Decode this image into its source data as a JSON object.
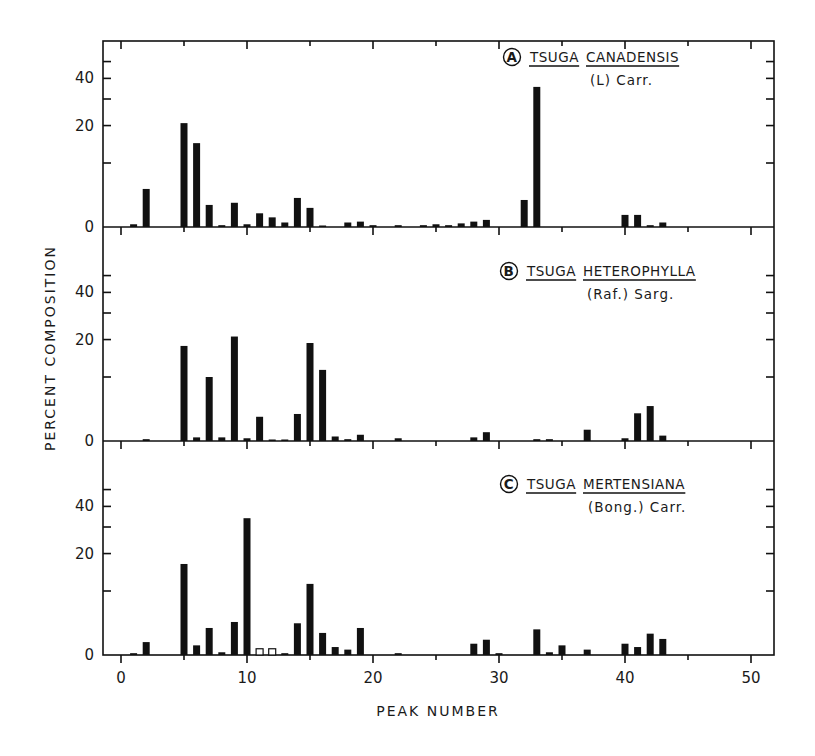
{
  "chart_data": {
    "type": "bar",
    "layout": "three vertically stacked panels sharing x-axis",
    "xlabel": "PEAK NUMBER",
    "ylabel": "PERCENT COMPOSITION",
    "x_ticks": [
      0,
      10,
      20,
      30,
      40,
      50
    ],
    "x_minor_ticks": [
      5,
      15,
      25,
      35,
      45
    ],
    "xlim": [
      -1.4,
      51.8
    ],
    "y_ticks": [
      0,
      20,
      40
    ],
    "y_minor_ticks": [
      10,
      30,
      50
    ],
    "y_scale": "nonlinear (approx. log10(1 + y/10))",
    "grid": false,
    "panels": [
      {
        "id": "A",
        "label": "A",
        "species": [
          "TSUGA",
          "CANADENSIS"
        ],
        "authority": "(L) Carr.",
        "bars": [
          {
            "peak": 1,
            "value": 0.3
          },
          {
            "peak": 2,
            "value": 5.1
          },
          {
            "peak": 5,
            "value": 20.8
          },
          {
            "peak": 6,
            "value": 14.8
          },
          {
            "peak": 7,
            "value": 2.7
          },
          {
            "peak": 8,
            "value": 0.2
          },
          {
            "peak": 9,
            "value": 3.0
          },
          {
            "peak": 10,
            "value": 0.3
          },
          {
            "peak": 11,
            "value": 1.6
          },
          {
            "peak": 12,
            "value": 1.1
          },
          {
            "peak": 13,
            "value": 0.5
          },
          {
            "peak": 14,
            "value": 3.7
          },
          {
            "peak": 15,
            "value": 2.3
          },
          {
            "peak": 16,
            "value": 0.1
          },
          {
            "peak": 18,
            "value": 0.5
          },
          {
            "peak": 19,
            "value": 0.6
          },
          {
            "peak": 20,
            "value": 0.2
          },
          {
            "peak": 22,
            "value": 0.2
          },
          {
            "peak": 24,
            "value": 0.2
          },
          {
            "peak": 25,
            "value": 0.3
          },
          {
            "peak": 26,
            "value": 0.2
          },
          {
            "peak": 27,
            "value": 0.4
          },
          {
            "peak": 28,
            "value": 0.6
          },
          {
            "peak": 29,
            "value": 0.8
          },
          {
            "peak": 32,
            "value": 3.4
          },
          {
            "peak": 33,
            "value": 35.6
          },
          {
            "peak": 40,
            "value": 1.4
          },
          {
            "peak": 41,
            "value": 1.4
          },
          {
            "peak": 42,
            "value": 0.2
          },
          {
            "peak": 43,
            "value": 0.5
          }
        ]
      },
      {
        "id": "B",
        "label": "B",
        "species": [
          "TSUGA",
          "HETEROPHYLLA"
        ],
        "authority": "(Raf.) Sarg.",
        "bars": [
          {
            "peak": 2,
            "value": 0.2
          },
          {
            "peak": 5,
            "value": 18.0
          },
          {
            "peak": 6,
            "value": 0.4
          },
          {
            "peak": 7,
            "value": 10.0
          },
          {
            "peak": 8,
            "value": 0.4
          },
          {
            "peak": 9,
            "value": 21.0
          },
          {
            "peak": 10,
            "value": 0.3
          },
          {
            "peak": 11,
            "value": 3.0
          },
          {
            "peak": 12,
            "value": 0.1
          },
          {
            "peak": 13,
            "value": 0.1
          },
          {
            "peak": 14,
            "value": 3.4
          },
          {
            "peak": 15,
            "value": 18.9
          },
          {
            "peak": 16,
            "value": 11.6
          },
          {
            "peak": 17,
            "value": 0.5
          },
          {
            "peak": 18,
            "value": 0.2
          },
          {
            "peak": 19,
            "value": 0.7
          },
          {
            "peak": 22,
            "value": 0.3
          },
          {
            "peak": 28,
            "value": 0.4
          },
          {
            "peak": 29,
            "value": 1.0
          },
          {
            "peak": 33,
            "value": 0.2
          },
          {
            "peak": 34,
            "value": 0.2
          },
          {
            "peak": 37,
            "value": 1.3
          },
          {
            "peak": 40,
            "value": 0.3
          },
          {
            "peak": 41,
            "value": 3.5
          },
          {
            "peak": 42,
            "value": 4.6
          },
          {
            "peak": 43,
            "value": 0.6
          }
        ]
      },
      {
        "id": "C",
        "label": "C",
        "species": [
          "TSUGA",
          "MERTENSIANA"
        ],
        "authority": "(Bong.) Carr.",
        "bars": [
          {
            "peak": 1,
            "value": 0.2
          },
          {
            "peak": 2,
            "value": 1.5
          },
          {
            "peak": 5,
            "value": 16.8
          },
          {
            "peak": 6,
            "value": 1.1
          },
          {
            "peak": 7,
            "value": 3.4
          },
          {
            "peak": 8,
            "value": 0.3
          },
          {
            "peak": 9,
            "value": 4.3
          },
          {
            "peak": 10,
            "value": 34.0
          },
          {
            "peak": 11,
            "value": 0.7,
            "open": true
          },
          {
            "peak": 12,
            "value": 0.7,
            "open": true
          },
          {
            "peak": 13,
            "value": 0.2
          },
          {
            "peak": 14,
            "value": 4.1
          },
          {
            "peak": 15,
            "value": 11.6
          },
          {
            "peak": 16,
            "value": 2.7
          },
          {
            "peak": 17,
            "value": 0.9
          },
          {
            "peak": 18,
            "value": 0.6
          },
          {
            "peak": 19,
            "value": 3.4
          },
          {
            "peak": 22,
            "value": 0.2
          },
          {
            "peak": 28,
            "value": 1.3
          },
          {
            "peak": 29,
            "value": 1.8
          },
          {
            "peak": 30,
            "value": 0.2
          },
          {
            "peak": 33,
            "value": 3.2
          },
          {
            "peak": 34,
            "value": 0.3
          },
          {
            "peak": 35,
            "value": 1.1
          },
          {
            "peak": 37,
            "value": 0.6
          },
          {
            "peak": 40,
            "value": 1.3
          },
          {
            "peak": 41,
            "value": 0.9
          },
          {
            "peak": 42,
            "value": 2.6
          },
          {
            "peak": 43,
            "value": 1.9
          }
        ]
      }
    ]
  },
  "colors": {
    "ink": "#111111",
    "background": "#ffffff"
  }
}
